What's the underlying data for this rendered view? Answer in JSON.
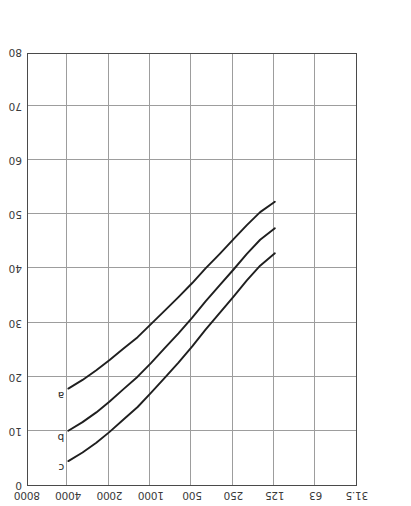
{
  "figure": {
    "orientation": "rotated-180",
    "background_color": "#ffffff",
    "frame_color": "#4a4a4a",
    "grid_color": "#9d9d9d",
    "curve_color": "#1f1f1f"
  },
  "chart_data": {
    "type": "line",
    "title": "",
    "xlabel": "Frequency (Hz)",
    "ylabel": "Third octave band sound pressure level, Lp (dB re 2 × 10−5 Pa)",
    "ylabel_parts": {
      "lead": "Third octave band sound pressure level, ",
      "symbol": "L",
      "symbol_sub": "p",
      "tail_open": "(dB re 2 ",
      "times": "×",
      "base": " 10",
      "exponent": "−5",
      "tail_close": " Pa)"
    },
    "x_type": "log",
    "x_tick_labels": [
      "31.5",
      "63",
      "125",
      "250",
      "500",
      "1000",
      "2000",
      "4000",
      "8000"
    ],
    "x_tick_values": [
      31.5,
      63,
      125,
      250,
      500,
      1000,
      2000,
      4000,
      8000
    ],
    "xlim": [
      31.5,
      8000
    ],
    "y_tick_labels": [
      "0",
      "10",
      "20",
      "30",
      "40",
      "50",
      "60",
      "70",
      "80"
    ],
    "y_tick_values": [
      0,
      10,
      20,
      30,
      40,
      50,
      60,
      70,
      80
    ],
    "ylim": [
      0,
      80
    ],
    "y_inverted": true,
    "grid": true,
    "legend_position": "inline-curve-labels",
    "series": [
      {
        "name": "a",
        "label": "a",
        "label_point": {
          "x": 4000,
          "y": 18.0
        },
        "points": [
          {
            "x": 4000,
            "y": 18.0
          },
          {
            "x": 3150,
            "y": 19.6
          },
          {
            "x": 2500,
            "y": 21.4
          },
          {
            "x": 2000,
            "y": 23.3
          },
          {
            "x": 1600,
            "y": 25.3
          },
          {
            "x": 1250,
            "y": 27.5
          },
          {
            "x": 1000,
            "y": 29.9
          },
          {
            "x": 800,
            "y": 32.3
          },
          {
            "x": 630,
            "y": 34.9
          },
          {
            "x": 500,
            "y": 37.5
          },
          {
            "x": 400,
            "y": 40.2
          },
          {
            "x": 315,
            "y": 42.9
          },
          {
            "x": 250,
            "y": 45.6
          },
          {
            "x": 200,
            "y": 48.2
          },
          {
            "x": 160,
            "y": 50.6
          },
          {
            "x": 125,
            "y": 52.5
          }
        ]
      },
      {
        "name": "b",
        "label": "b",
        "label_point": {
          "x": 4000,
          "y": 10.2
        },
        "points": [
          {
            "x": 4000,
            "y": 10.2
          },
          {
            "x": 3150,
            "y": 11.8
          },
          {
            "x": 2500,
            "y": 13.6
          },
          {
            "x": 2000,
            "y": 15.6
          },
          {
            "x": 1600,
            "y": 17.8
          },
          {
            "x": 1250,
            "y": 20.2
          },
          {
            "x": 1000,
            "y": 22.7
          },
          {
            "x": 800,
            "y": 25.4
          },
          {
            "x": 630,
            "y": 28.2
          },
          {
            "x": 500,
            "y": 31.1
          },
          {
            "x": 400,
            "y": 34.1
          },
          {
            "x": 315,
            "y": 37.1
          },
          {
            "x": 250,
            "y": 40.0
          },
          {
            "x": 200,
            "y": 42.9
          },
          {
            "x": 160,
            "y": 45.5
          },
          {
            "x": 125,
            "y": 47.6
          }
        ]
      },
      {
        "name": "c",
        "label": "c",
        "label_point": {
          "x": 4000,
          "y": 4.6
        },
        "points": [
          {
            "x": 4000,
            "y": 4.6
          },
          {
            "x": 3150,
            "y": 6.2
          },
          {
            "x": 2500,
            "y": 8.0
          },
          {
            "x": 2000,
            "y": 10.0
          },
          {
            "x": 1600,
            "y": 12.2
          },
          {
            "x": 1250,
            "y": 14.6
          },
          {
            "x": 1000,
            "y": 17.2
          },
          {
            "x": 800,
            "y": 19.9
          },
          {
            "x": 630,
            "y": 22.8
          },
          {
            "x": 500,
            "y": 25.8
          },
          {
            "x": 400,
            "y": 28.9
          },
          {
            "x": 315,
            "y": 32.0
          },
          {
            "x": 250,
            "y": 35.0
          },
          {
            "x": 200,
            "y": 38.0
          },
          {
            "x": 160,
            "y": 40.7
          },
          {
            "x": 125,
            "y": 43.0
          }
        ]
      }
    ]
  }
}
